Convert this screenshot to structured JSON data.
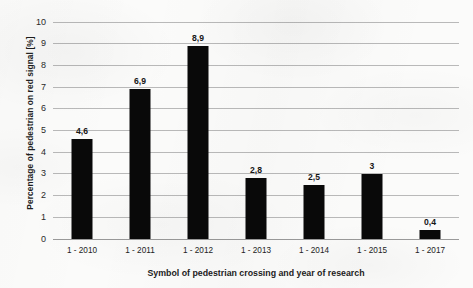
{
  "chart_data": {
    "type": "bar",
    "title": "",
    "xlabel": "Symbol of pedestrian crossing and year of research",
    "ylabel": "Percentage of pedestrian on red signal [%]",
    "categories": [
      "1 - 2010",
      "1 - 2011",
      "1 - 2012",
      "1 - 2013",
      "1 - 2014",
      "1 - 2015",
      "1 - 2017"
    ],
    "values": [
      4.6,
      6.9,
      8.9,
      2.8,
      2.5,
      3,
      0.4
    ],
    "value_labels": [
      "4,6",
      "6,9",
      "8,9",
      "2,8",
      "2,5",
      "3",
      "0,4"
    ],
    "ylim": [
      0,
      10
    ],
    "ytick_step": 1,
    "ytick_labels": [
      "0",
      "1",
      "2",
      "3",
      "4",
      "5",
      "6",
      "7",
      "8",
      "9",
      "10"
    ],
    "grid": "horizontal",
    "legend": "none",
    "bar_color": "#090909",
    "gridline_color": "#b9b9b9",
    "background_color": "#fbfbfa"
  }
}
